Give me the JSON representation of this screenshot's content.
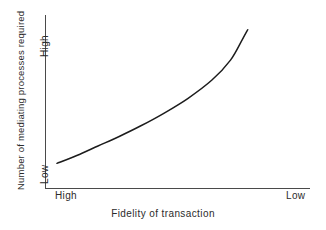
{
  "chart_data": {
    "type": "line",
    "title": "",
    "xlabel": "Fidelity of transaction",
    "ylabel": "Number of mediating processes required",
    "x_tick_labels": [
      "High",
      "Low"
    ],
    "y_tick_labels": [
      "Low",
      "High"
    ],
    "x_axis_direction": "High to Low (left to right)",
    "y_axis_direction": "Low to High (bottom to top)",
    "grid": false,
    "legend": false,
    "xlim": [
      0,
      1
    ],
    "ylim": [
      0,
      1
    ],
    "series": [
      {
        "name": "Mediating processes vs fidelity",
        "description": "Monotonic increasing, convex (exponential-like) curve rising from lower-left to upper-right",
        "x": [
          0.045,
          0.12,
          0.2,
          0.28,
          0.36,
          0.45,
          0.54,
          0.63,
          0.7,
          0.745,
          0.765
        ],
        "y": [
          0.145,
          0.19,
          0.245,
          0.3,
          0.36,
          0.435,
          0.52,
          0.625,
          0.74,
          0.86,
          0.915
        ]
      }
    ],
    "colors": {
      "curve": "#1c1c1c",
      "axis": "#4a4a4a",
      "background": "#ffffff",
      "text": "#2b2b2b"
    }
  },
  "axes": {
    "y_title": "Number of mediating processes required",
    "y_tick_top": "High",
    "y_tick_bottom": "Low",
    "x_title": "Fidelity of transaction",
    "x_tick_left": "High",
    "x_tick_right": "Low"
  }
}
